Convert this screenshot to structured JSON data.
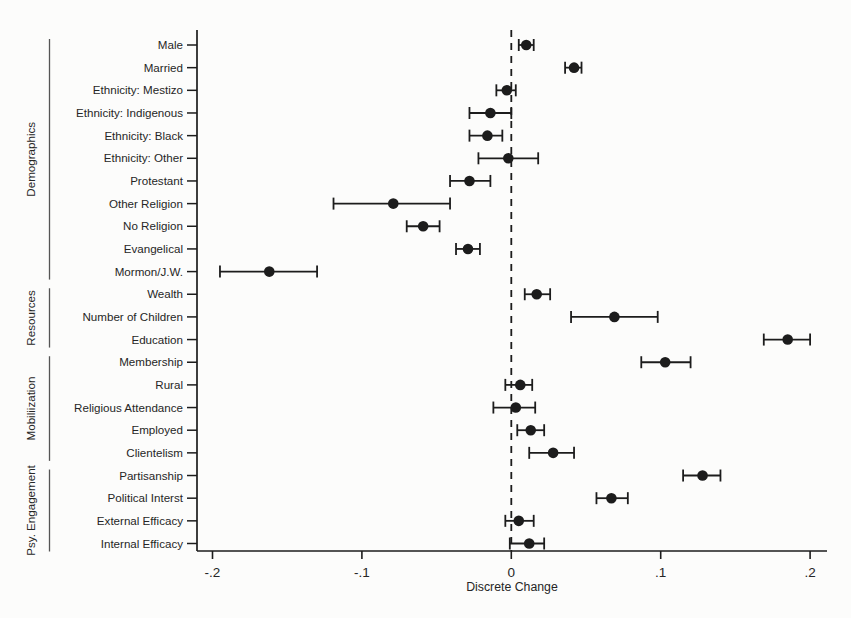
{
  "figure": {
    "background": "#fcfcfb",
    "ink": "#1c1c1c"
  },
  "chart_data": {
    "type": "scatter",
    "subtype": "dot-and-whisker coefficient plot",
    "title": "",
    "xlabel": "Discrete Change",
    "ylabel": "",
    "grid": "off",
    "legend": "none",
    "xlim": [
      -0.21,
      0.212
    ],
    "zero_reference_line": 0,
    "x_ticks": [
      {
        "value": -0.2,
        "label": "-.2"
      },
      {
        "value": -0.1,
        "label": "-.1"
      },
      {
        "value": 0,
        "label": "0"
      },
      {
        "value": 0.1,
        "label": ".1"
      },
      {
        "value": 0.2,
        "label": ".2"
      }
    ],
    "groups": [
      "Demographics",
      "Resources",
      "Mobiliization",
      "Psy. Engagement"
    ],
    "rows": [
      {
        "group": "Demographics",
        "label": "Male",
        "estimate": 0.01,
        "ci_low": 0.005,
        "ci_high": 0.015
      },
      {
        "group": "Demographics",
        "label": "Married",
        "estimate": 0.042,
        "ci_low": 0.036,
        "ci_high": 0.047
      },
      {
        "group": "Demographics",
        "label": "Ethnicity: Mestizo",
        "estimate": -0.003,
        "ci_low": -0.01,
        "ci_high": 0.003
      },
      {
        "group": "Demographics",
        "label": "Ethnicity: Indigenous",
        "estimate": -0.014,
        "ci_low": -0.028,
        "ci_high": 0.0
      },
      {
        "group": "Demographics",
        "label": "Ethnicity: Black",
        "estimate": -0.016,
        "ci_low": -0.028,
        "ci_high": -0.006
      },
      {
        "group": "Demographics",
        "label": "Ethnicity: Other",
        "estimate": -0.002,
        "ci_low": -0.022,
        "ci_high": 0.018
      },
      {
        "group": "Demographics",
        "label": "Protestant",
        "estimate": -0.028,
        "ci_low": -0.041,
        "ci_high": -0.014
      },
      {
        "group": "Demographics",
        "label": "Other Religion",
        "estimate": -0.079,
        "ci_low": -0.119,
        "ci_high": -0.041
      },
      {
        "group": "Demographics",
        "label": "No Religion",
        "estimate": -0.059,
        "ci_low": -0.07,
        "ci_high": -0.048
      },
      {
        "group": "Demographics",
        "label": "Evangelical",
        "estimate": -0.029,
        "ci_low": -0.037,
        "ci_high": -0.021
      },
      {
        "group": "Demographics",
        "label": "Mormon/J.W.",
        "estimate": -0.162,
        "ci_low": -0.195,
        "ci_high": -0.13
      },
      {
        "group": "Resources",
        "label": "Wealth",
        "estimate": 0.017,
        "ci_low": 0.009,
        "ci_high": 0.026
      },
      {
        "group": "Resources",
        "label": "Number of Children",
        "estimate": 0.069,
        "ci_low": 0.04,
        "ci_high": 0.098
      },
      {
        "group": "Resources",
        "label": "Education",
        "estimate": 0.185,
        "ci_low": 0.169,
        "ci_high": 0.2
      },
      {
        "group": "Mobiliization",
        "label": "Membership",
        "estimate": 0.103,
        "ci_low": 0.087,
        "ci_high": 0.12
      },
      {
        "group": "Mobiliization",
        "label": "Rural",
        "estimate": 0.006,
        "ci_low": -0.004,
        "ci_high": 0.014
      },
      {
        "group": "Mobiliization",
        "label": "Religious Attendance",
        "estimate": 0.003,
        "ci_low": -0.012,
        "ci_high": 0.016
      },
      {
        "group": "Mobiliization",
        "label": "Employed",
        "estimate": 0.013,
        "ci_low": 0.004,
        "ci_high": 0.022
      },
      {
        "group": "Mobiliization",
        "label": "Clientelism",
        "estimate": 0.028,
        "ci_low": 0.012,
        "ci_high": 0.042
      },
      {
        "group": "Psy. Engagement",
        "label": "Partisanship",
        "estimate": 0.128,
        "ci_low": 0.115,
        "ci_high": 0.14
      },
      {
        "group": "Psy. Engagement",
        "label": "Political Interst",
        "estimate": 0.067,
        "ci_low": 0.057,
        "ci_high": 0.078
      },
      {
        "group": "Psy. Engagement",
        "label": "External Efficacy",
        "estimate": 0.005,
        "ci_low": -0.004,
        "ci_high": 0.015
      },
      {
        "group": "Psy. Engagement",
        "label": "Internal Efficacy",
        "estimate": 0.012,
        "ci_low": -0.001,
        "ci_high": 0.022
      }
    ]
  }
}
